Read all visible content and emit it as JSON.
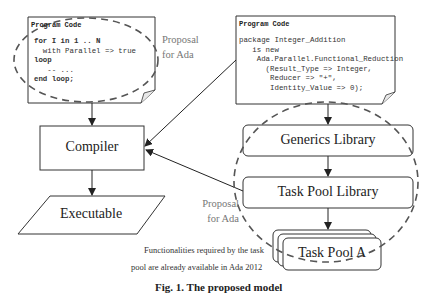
{
  "diagram": {
    "left_code": {
      "title": "Program Code",
      "lines": [
        "for I in 1 .. N",
        "  with Parallel => true",
        "loop",
        "   -- ...",
        "end loop;"
      ]
    },
    "right_code": {
      "title": "Program Code",
      "lines": [
        "package Integer_Addition",
        "   is new",
        "    Ada.Parallel.Functional_Reduction",
        "      (Result_Type => Integer,",
        "       Reducer => \"+\",",
        "       Identity_Value => 0);"
      ]
    },
    "proposal_top": {
      "line1": "Proposal",
      "line2": "for Ada"
    },
    "proposal_bottom": {
      "line1": "Proposal",
      "line2": "for Ada"
    },
    "compiler": "Compiler",
    "executable": "Executable",
    "generics_library": "Generics Library",
    "task_pool_library": "Task Pool Library",
    "task_pool_a": "Task Pool A",
    "note": {
      "line1": "Functionalities required by the task",
      "line2": "pool are already available in Ada 2012"
    },
    "caption": "Fig. 1. The proposed model"
  },
  "colors": {
    "stroke": "#333333",
    "dashed": "#666666",
    "grey_text": "#777777"
  }
}
